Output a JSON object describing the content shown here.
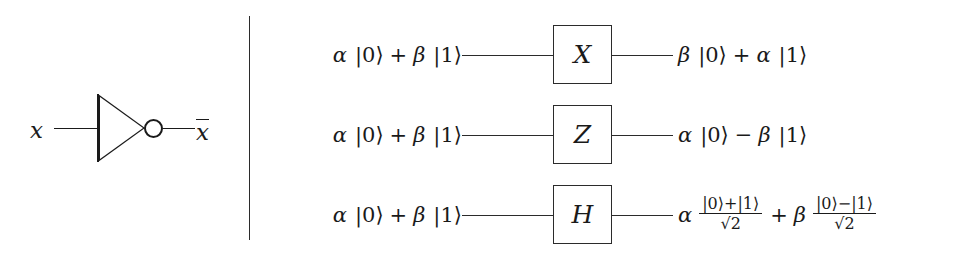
{
  "figure": {
    "background_color": "#ffffff",
    "ink_color": "#1a1a1a",
    "divider_color": "#2b2b2b"
  },
  "classical_panel": {
    "gate_name": "not-gate",
    "gate_symbol": "triangle-with-bubble",
    "input_label": "x",
    "output_label": "x",
    "output_has_overline": true,
    "output_label_rendered": "x̄"
  },
  "quantum_panel": {
    "rows": [
      {
        "gate": "X",
        "gate_name": "pauli-x-gate",
        "input": {
          "coef1": "α",
          "ket1": "|0⟩",
          "operator": "+",
          "coef2": "β",
          "ket2": "|1⟩",
          "text": "α |0⟩ + β |1⟩"
        },
        "output": {
          "kind": "simple",
          "coef1": "β",
          "ket1": "|0⟩",
          "operator": "+",
          "coef2": "α",
          "ket2": "|1⟩",
          "text": "β |0⟩ + α |1⟩"
        }
      },
      {
        "gate": "Z",
        "gate_name": "pauli-z-gate",
        "input": {
          "coef1": "α",
          "ket1": "|0⟩",
          "operator": "+",
          "coef2": "β",
          "ket2": "|1⟩",
          "text": "α |0⟩ + β |1⟩"
        },
        "output": {
          "kind": "simple",
          "coef1": "α",
          "ket1": "|0⟩",
          "operator": "−",
          "coef2": "β",
          "ket2": "|1⟩",
          "text": "α |0⟩ − β |1⟩"
        }
      },
      {
        "gate": "H",
        "gate_name": "hadamard-gate",
        "input": {
          "coef1": "α",
          "ket1": "|0⟩",
          "operator": "+",
          "coef2": "β",
          "ket2": "|1⟩",
          "text": "α |0⟩ + β |1⟩"
        },
        "output": {
          "kind": "fraction",
          "coef1": "α",
          "frac1_num": "|0⟩+|1⟩",
          "frac1_den_radicand": "2",
          "operator": "+",
          "coef2": "β",
          "frac2_num": "|0⟩−|1⟩",
          "frac2_den_radicand": "2",
          "text": "α (|0⟩+|1⟩)/√2 + β (|0⟩−|1⟩)/√2"
        }
      }
    ]
  }
}
